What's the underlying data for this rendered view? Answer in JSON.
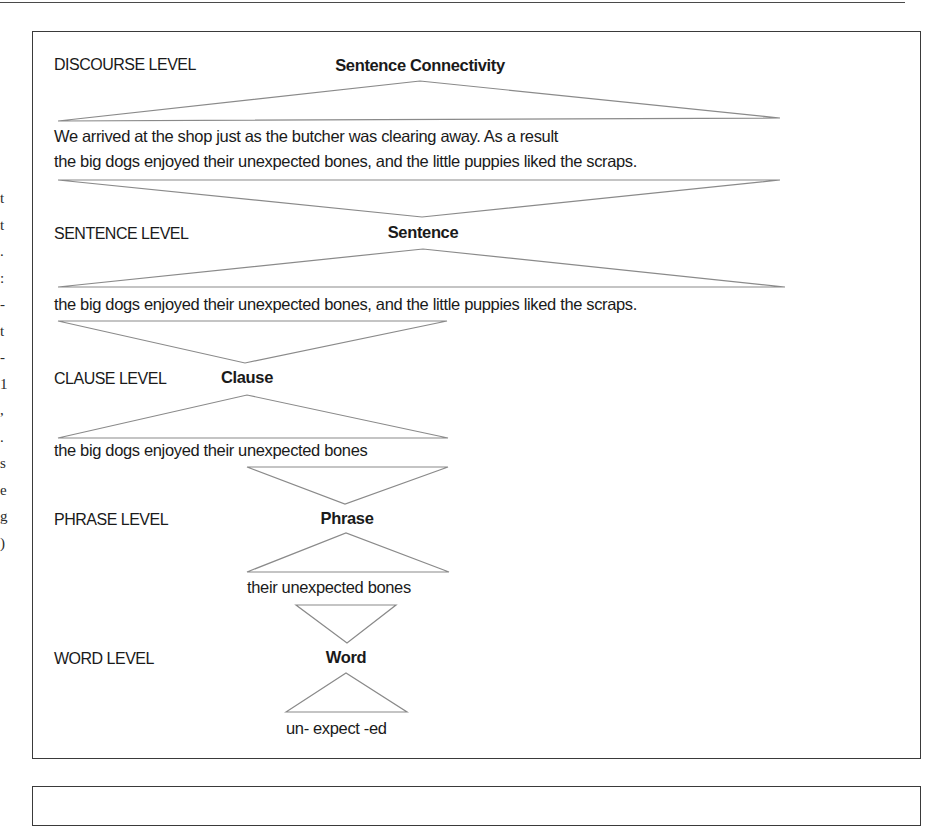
{
  "figure": {
    "levels": [
      {
        "level_label": "DISCOURSE LEVEL",
        "unit_label": "Sentence Connectivity",
        "example_lines": [
          "We arrived at the shop just as the butcher was clearing away. As a result",
          "the big dogs enjoyed their unexpected bones, and the little puppies liked the scraps."
        ]
      },
      {
        "level_label": "SENTENCE LEVEL",
        "unit_label": "Sentence",
        "example_lines": [
          "the big dogs enjoyed their unexpected bones, and the little puppies liked the scraps."
        ]
      },
      {
        "level_label": "CLAUSE LEVEL",
        "unit_label": "Clause",
        "example_lines": [
          "the big dogs enjoyed their unexpected bones"
        ]
      },
      {
        "level_label": "PHRASE LEVEL",
        "unit_label": "Phrase",
        "example_lines": [
          "their unexpected bones"
        ]
      },
      {
        "level_label": "WORD LEVEL",
        "unit_label": "Word",
        "example_lines": [
          "un- expect -ed"
        ]
      }
    ]
  },
  "margin_fragments": "t\nt\n.\n:\n-\nt\n-\n1\n,\n.\ns\ne\ng\n)"
}
